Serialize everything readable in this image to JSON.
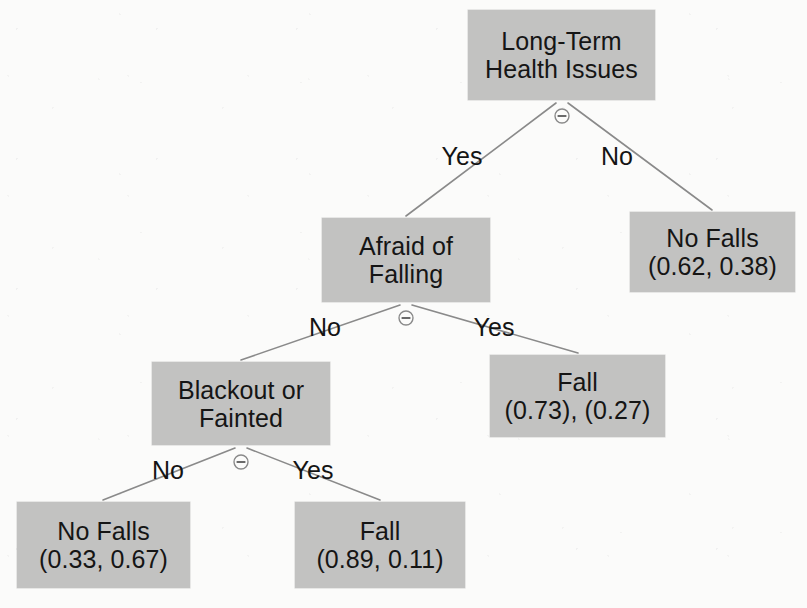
{
  "diagram": {
    "type": "decision-tree",
    "colors": {
      "node_fill": "#c2c2c1",
      "node_text": "#151515",
      "edge_line": "#8a8a8a",
      "background": "#fbfbfa"
    },
    "split_icon": "circled-minus-icon"
  },
  "nodes": [
    {
      "id": "root",
      "kind": "internal",
      "line1": "Long-Term",
      "line2": "Health Issues",
      "x": 468,
      "y": 10,
      "w": 187,
      "h": 90
    },
    {
      "id": "afraid-of-falling",
      "kind": "internal",
      "line1": "Afraid of",
      "line2": "Falling",
      "x": 322,
      "y": 218,
      "w": 168,
      "h": 84
    },
    {
      "id": "no-falls-right",
      "kind": "leaf",
      "line1": "No Falls",
      "line2": "(0.62, 0.38)",
      "x": 630,
      "y": 212,
      "w": 165,
      "h": 80
    },
    {
      "id": "blackout-or-fainted",
      "kind": "internal",
      "line1": "Blackout or",
      "line2": "Fainted",
      "x": 152,
      "y": 362,
      "w": 178,
      "h": 83
    },
    {
      "id": "fall-073",
      "kind": "leaf",
      "line1": "Fall",
      "line2": "(0.73), (0.27)",
      "x": 490,
      "y": 355,
      "w": 175,
      "h": 82
    },
    {
      "id": "no-falls-bottom",
      "kind": "leaf",
      "line1": "No Falls",
      "line2": "(0.33, 0.67)",
      "x": 17,
      "y": 502,
      "w": 173,
      "h": 86
    },
    {
      "id": "fall-089",
      "kind": "leaf",
      "line1": "Fall",
      "line2": "(0.89, 0.11)",
      "x": 295,
      "y": 502,
      "w": 170,
      "h": 86
    }
  ],
  "edge_labels": [
    {
      "id": "root-yes",
      "text": "Yes",
      "x": 462,
      "y": 156
    },
    {
      "id": "root-no",
      "text": "No",
      "x": 617,
      "y": 156
    },
    {
      "id": "afraid-no",
      "text": "No",
      "x": 325,
      "y": 327
    },
    {
      "id": "afraid-yes",
      "text": "Yes",
      "x": 494,
      "y": 327
    },
    {
      "id": "blackout-no",
      "text": "No",
      "x": 168,
      "y": 470
    },
    {
      "id": "blackout-yes",
      "text": "Yes",
      "x": 313,
      "y": 470
    }
  ],
  "split_icons": [
    {
      "id": "root-split",
      "x": 562,
      "y": 116
    },
    {
      "id": "afraid-split",
      "x": 406,
      "y": 318
    },
    {
      "id": "blackout-split",
      "x": 241,
      "y": 462
    }
  ],
  "edges": [
    {
      "id": "root-to-afraid",
      "x1": 556,
      "y1": 103,
      "x2": 406,
      "y2": 216,
      "label": "Yes"
    },
    {
      "id": "root-to-no-falls",
      "x1": 568,
      "y1": 103,
      "x2": 712,
      "y2": 210,
      "label": "No"
    },
    {
      "id": "afraid-to-blackout",
      "x1": 400,
      "y1": 305,
      "x2": 241,
      "y2": 360,
      "label": "No"
    },
    {
      "id": "afraid-to-fall073",
      "x1": 412,
      "y1": 305,
      "x2": 578,
      "y2": 353,
      "label": "Yes"
    },
    {
      "id": "blackout-to-no-falls",
      "x1": 235,
      "y1": 448,
      "x2": 103,
      "y2": 500,
      "label": "No"
    },
    {
      "id": "blackout-to-fall089",
      "x1": 247,
      "y1": 448,
      "x2": 380,
      "y2": 500,
      "label": "Yes"
    }
  ],
  "chart_data": {
    "type": "tree",
    "root": "Long-Term Health Issues",
    "class_probability_order": "(class 1, class 2)",
    "splits": [
      {
        "node": "Long-Term Health Issues",
        "branches": [
          {
            "label": "Yes",
            "to": "Afraid of Falling"
          },
          {
            "label": "No",
            "to": "No Falls",
            "probabilities": [
              0.62,
              0.38
            ]
          }
        ]
      },
      {
        "node": "Afraid of Falling",
        "branches": [
          {
            "label": "No",
            "to": "Blackout or Fainted"
          },
          {
            "label": "Yes",
            "to": "Fall",
            "probabilities": [
              0.73,
              0.27
            ]
          }
        ]
      },
      {
        "node": "Blackout or Fainted",
        "branches": [
          {
            "label": "No",
            "to": "No Falls",
            "probabilities": [
              0.33,
              0.67
            ]
          },
          {
            "label": "Yes",
            "to": "Fall",
            "probabilities": [
              0.89,
              0.11
            ]
          }
        ]
      }
    ],
    "leaves": [
      {
        "label": "No Falls",
        "probabilities": [
          0.62,
          0.38
        ],
        "text": "(0.62, 0.38)"
      },
      {
        "label": "Fall",
        "probabilities": [
          0.73,
          0.27
        ],
        "text": "(0.73), (0.27)"
      },
      {
        "label": "No Falls",
        "probabilities": [
          0.33,
          0.67
        ],
        "text": "(0.33, 0.67)"
      },
      {
        "label": "Fall",
        "probabilities": [
          0.89,
          0.11
        ],
        "text": "(0.89, 0.11)"
      }
    ]
  }
}
